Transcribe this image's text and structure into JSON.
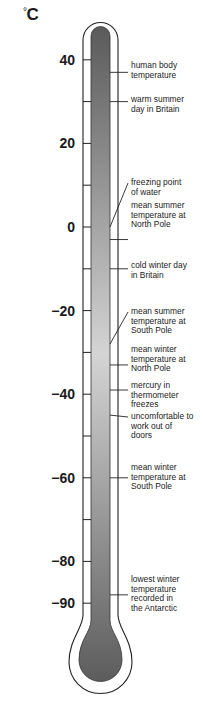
{
  "diagram": {
    "unit_symbol": "°",
    "unit_letter": "C",
    "scale": {
      "min": -90,
      "max": 40,
      "step": 10,
      "px_per_degree": 4.18,
      "zero_y": 227,
      "labeled_values": [
        40,
        20,
        0,
        -20,
        -40,
        -60,
        -80,
        -90
      ],
      "labels": [
        "40",
        "20",
        "0",
        "−20",
        "−40",
        "−60",
        "−80",
        "−90"
      ]
    },
    "colors": {
      "fluid_top": "#5a5a5a",
      "fluid_mid": "#d4d4d4",
      "fluid_bottom": "#5c5c5c",
      "outline": "#222222"
    },
    "annotations": [
      {
        "text": "human body\ntemperature",
        "temperature": 37,
        "label_y": 61,
        "pointer": "straight"
      },
      {
        "text": "warm summer\nday in Britain",
        "temperature": 30,
        "label_y": 95,
        "pointer": "straight"
      },
      {
        "text": "freezing point\nof water",
        "temperature": 0,
        "label_y": 178,
        "pointer": "diagonal"
      },
      {
        "text": "mean summer\ntemperature at\nNorth Pole",
        "temperature": -3,
        "label_y": 201,
        "pointer": "straight"
      },
      {
        "text": "cold winter day\nin Britain",
        "temperature": -10,
        "label_y": 261,
        "pointer": "straight"
      },
      {
        "text": "mean summer\ntemperature at\nSouth Pole",
        "temperature": -28,
        "label_y": 307,
        "pointer": "diagonal"
      },
      {
        "text": "mean winter\ntemperature at\nNorth Pole",
        "temperature": -33,
        "label_y": 345,
        "pointer": "straight"
      },
      {
        "text": "mercury in\nthermometer\nfreezes",
        "temperature": -39,
        "label_y": 381,
        "pointer": "straight"
      },
      {
        "text": "uncomfortable to\nwork out of\ndoors",
        "temperature": -45,
        "label_y": 412,
        "pointer": "diagonal"
      },
      {
        "text": "mean winter\ntemperature at\nSouth Pole",
        "temperature": -60,
        "label_y": 463,
        "pointer": "straight"
      },
      {
        "text": "lowest winter\ntemperature\nrecorded in\nthe Antarctic",
        "temperature": -88,
        "label_y": 575,
        "pointer": "straight"
      }
    ]
  }
}
